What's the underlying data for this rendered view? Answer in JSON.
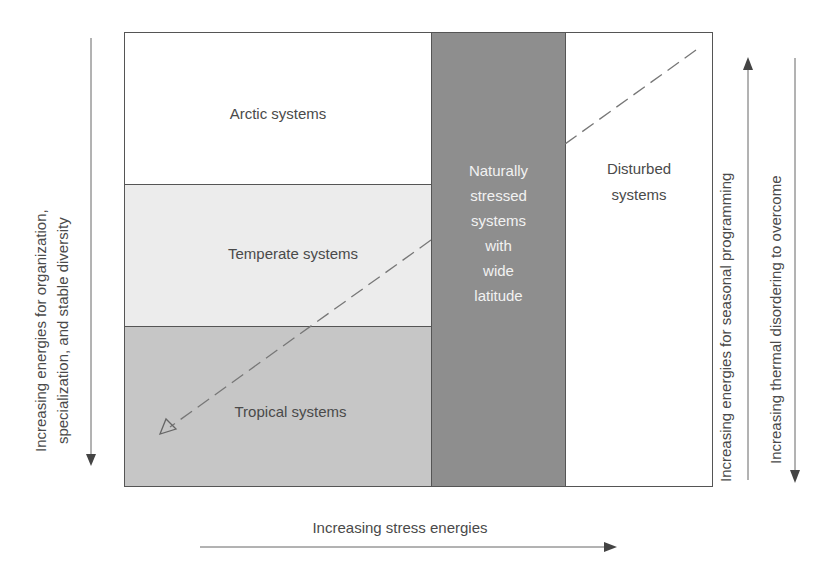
{
  "regions": {
    "arctic": {
      "label": "Arctic systems",
      "color": "#ffffff"
    },
    "temperate": {
      "label": "Temperate systems",
      "color": "#ececec"
    },
    "tropical": {
      "label": "Tropical systems",
      "color": "#c6c6c6"
    },
    "stressed": {
      "label_lines": [
        "Naturally",
        "stressed",
        "systems",
        "with",
        "wide",
        "latitude"
      ],
      "color": "#8e8e8e"
    },
    "disturbed": {
      "label_lines": [
        "Disturbed",
        "systems"
      ],
      "color": "#ffffff"
    }
  },
  "axes": {
    "left": {
      "lines": [
        "Increasing energies for organization,",
        "specialization, and stable diversity"
      ],
      "direction": "down"
    },
    "bottom": {
      "label": "Increasing stress energies",
      "direction": "right"
    },
    "right_inner": {
      "label": "Increasing energies for seasonal programming",
      "direction": "up"
    },
    "right_outer": {
      "label": "Increasing thermal disordering to overcome",
      "direction": "down"
    }
  },
  "dashed_arrow": {
    "from": [
      696,
      50
    ],
    "to": [
      162,
      433
    ],
    "head": "open"
  }
}
